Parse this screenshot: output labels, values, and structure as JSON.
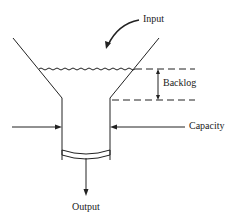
{
  "diagram": {
    "labels": {
      "input": "Input",
      "backlog": "Backlog",
      "capacity": "Capacity",
      "output": "Output"
    },
    "colors": {
      "line": "#222222",
      "background": "#ffffff"
    }
  }
}
